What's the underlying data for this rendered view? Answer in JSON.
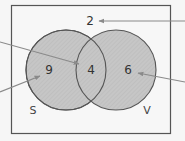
{
  "diagram": {
    "type": "venn",
    "universe": {
      "count": "2"
    },
    "sets": [
      {
        "label": "S",
        "only_count": "9"
      },
      {
        "label": "V",
        "only_count": "6"
      }
    ],
    "intersection": {
      "count": "4"
    },
    "colors": {
      "background": "#f6f6f6",
      "circle_fill": "#c4c4c4",
      "outline": "#555555",
      "arrow": "#8a8a8a"
    },
    "arrows": [
      {
        "target": "outside",
        "from": [
          185,
          21
        ],
        "to": [
          99,
          21
        ]
      },
      {
        "target": "intersection",
        "from": [
          0,
          42
        ],
        "to": [
          79,
          64
        ]
      },
      {
        "target": "S-only",
        "from": [
          0,
          92
        ],
        "to": [
          40,
          76
        ]
      },
      {
        "target": "V-only",
        "from": [
          185,
          82
        ],
        "to": [
          138,
          73
        ]
      }
    ]
  }
}
